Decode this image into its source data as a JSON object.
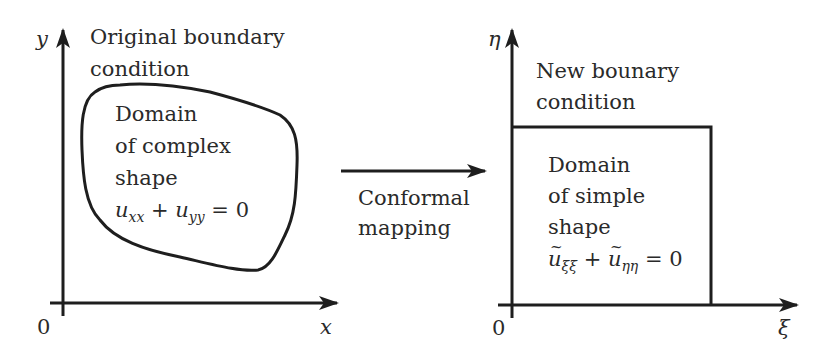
{
  "left_panel": {
    "y_axis_label": "y",
    "x_axis_label": "x",
    "origin_label": "0",
    "boundary_label_line1": "Original boundary",
    "boundary_label_line2": "condition",
    "domain_line1": "Domain",
    "domain_line2": "of complex",
    "domain_line3": "shape",
    "equation": {
      "var1": "u",
      "sub1": "xx",
      "plus": "+",
      "var2": "u",
      "sub2": "yy",
      "equals": "= 0"
    }
  },
  "middle": {
    "arrow_label_line1": "Conformal",
    "arrow_label_line2": "mapping"
  },
  "right_panel": {
    "y_axis_label": "η",
    "x_axis_label": "ξ",
    "origin_label": "0",
    "boundary_label_line1": "New bounary",
    "boundary_label_line2": "condition",
    "domain_line1": "Domain",
    "domain_line2": "of simple",
    "domain_line3": "shape",
    "equation": {
      "var1": "u",
      "sub1": "ξξ",
      "plus": "+",
      "var2": "u",
      "sub2": "ηη",
      "equals": "= 0"
    }
  },
  "colors": {
    "stroke": "#1e1e1e",
    "text": "#2a2a2a",
    "background": "#ffffff"
  }
}
